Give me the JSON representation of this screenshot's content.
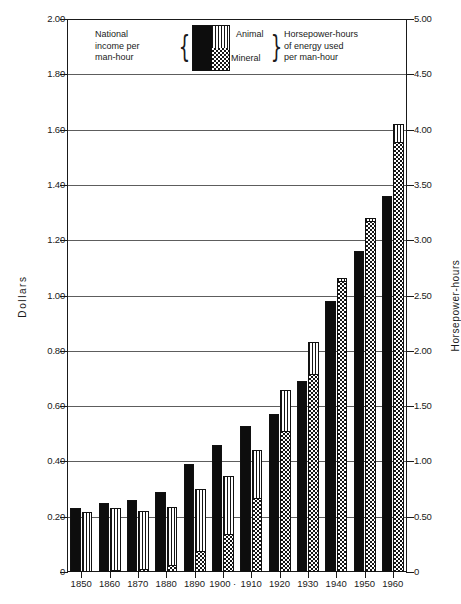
{
  "chart_data": {
    "type": "bar",
    "title": "",
    "subtitle": "",
    "categories": [
      "1850",
      "1860",
      "1870",
      "1880",
      "1890",
      "1900 ·",
      "1910",
      "1920",
      "1930",
      "1940",
      "1950",
      "1960"
    ],
    "xlabel": "",
    "ylabel": "Dollars",
    "ylabel_right": "Horsepower-hours",
    "ylim": [
      0,
      2.0
    ],
    "ylim_right": [
      0,
      5.0
    ],
    "yticks": [
      "0",
      "0.20",
      "0.40",
      "0.60",
      "0.80",
      "1.00",
      "1.20",
      "1.40",
      "1.60",
      "1.80",
      "2.00"
    ],
    "ytick_values": [
      0,
      0.2,
      0.4,
      0.6,
      0.8,
      1.0,
      1.2,
      1.4,
      1.6,
      1.8,
      2.0
    ],
    "yticks_right": [
      "0",
      "0.50",
      "1.00",
      "1.50",
      "2.00",
      "2.50",
      "3.00",
      "3.50",
      "4.00",
      "4.50",
      "5.00"
    ],
    "ytick_values_right": [
      0,
      0.5,
      1.0,
      1.5,
      2.0,
      2.5,
      3.0,
      3.5,
      4.0,
      4.5,
      5.0
    ],
    "grid": true,
    "legend_position": "top-center",
    "series": [
      {
        "name": "National income per man-hour",
        "unit": "Dollars",
        "axis": "left",
        "pattern": "solid-black",
        "values": [
          0.23,
          0.25,
          0.26,
          0.29,
          0.39,
          0.46,
          0.53,
          0.57,
          0.69,
          0.98,
          1.16,
          1.36
        ]
      },
      {
        "name": "Mineral",
        "unit": "Horsepower-hours",
        "axis": "right",
        "pattern": "checkerboard",
        "values": [
          0.02,
          0.03,
          0.04,
          0.07,
          0.2,
          0.35,
          0.68,
          1.28,
          1.8,
          2.64,
          3.18,
          3.9
        ]
      },
      {
        "name": "Animal",
        "unit": "Horsepower-hours",
        "axis": "right",
        "pattern": "vertical-stripes",
        "values": [
          0.52,
          0.55,
          0.51,
          0.52,
          0.55,
          0.52,
          0.42,
          0.37,
          0.28,
          0.02,
          0.02,
          0.15
        ]
      },
      {
        "name": "Total energy used per man-hour",
        "unit": "Horsepower-hours",
        "axis": "right",
        "pattern": "stacked-total",
        "values": [
          0.54,
          0.58,
          0.55,
          0.59,
          0.75,
          0.87,
          1.1,
          1.65,
          2.08,
          2.66,
          3.2,
          4.05
        ]
      }
    ]
  },
  "legend": {
    "left_text": "National\nincome per\nman-hour",
    "left_line1": "National",
    "left_line2": "income per",
    "left_line3": "man-hour",
    "animal_label": "Animal",
    "mineral_label": "Mineral",
    "right_line1": "Horsepower-hours",
    "right_line2": "of energy used",
    "right_line3": "per man-hour",
    "brace_left": "{",
    "brace_right": "}"
  },
  "axes": {
    "left_title": "Dollars",
    "right_title": "Horsepower-hours"
  },
  "colors": {
    "ink": "#111111",
    "grid": "#5d5d5d",
    "background": "#ffffff",
    "income_fill": "#0d0d0d"
  }
}
